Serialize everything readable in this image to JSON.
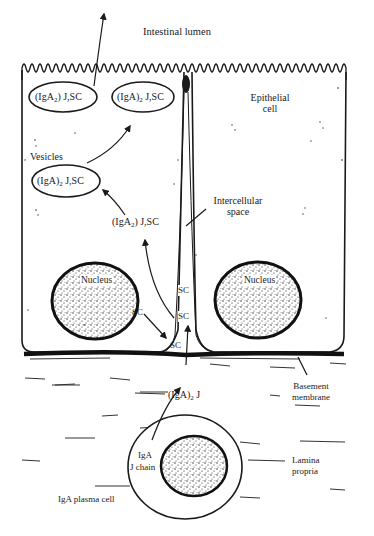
{
  "colors": {
    "ink": "#1a1a1a",
    "background": "#ffffff",
    "stipple": "#2a2a2a"
  },
  "regions": {
    "intestinal_lumen": "Intestinal lumen",
    "epithelial_cell": [
      "Epithelial",
      "cell"
    ],
    "intercellular_space": [
      "Intercellular",
      "space"
    ],
    "basement_membrane": [
      "Basement",
      "membrane"
    ],
    "lamina_propria": [
      "Lamina",
      "propria"
    ],
    "plasma_cell": "IgA plasma cell"
  },
  "vesicles": {
    "label": "Vesicles",
    "top_left": {
      "pre": "(IgA",
      "sub": "2",
      "post": ") J,SC"
    },
    "top_right": {
      "pre": "(IgA)",
      "sub": "2",
      "post": " J,SC"
    },
    "middle": {
      "pre": "(IgA)",
      "sub": "2",
      "post": " J,SC"
    }
  },
  "free_labels": {
    "cytoplasm_complex": {
      "pre": "(IgA",
      "sub": "2",
      "post": ") J,SC"
    },
    "dimer": {
      "pre": "(IgA)",
      "sub": "2",
      "post": " J"
    },
    "sc_left": "SC",
    "sc_space_upper": "SC",
    "sc_space_middle": "SC",
    "sc_space_bottom": "SC",
    "iga": "IgA",
    "j_chain": "J chain"
  },
  "nuclei": {
    "left": "Nucleus",
    "right": "Nucleus"
  }
}
